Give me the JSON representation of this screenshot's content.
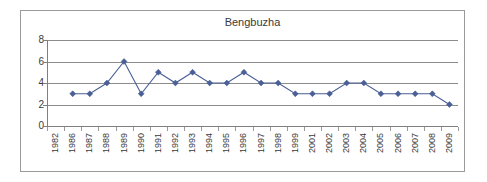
{
  "chart_data": {
    "type": "line",
    "title": "Bengbuzha",
    "xlabel": "",
    "ylabel": "",
    "ylim": [
      0,
      8
    ],
    "ytick_labels": [
      "8",
      "6",
      "4",
      "2",
      "0"
    ],
    "ytick_values": [
      8,
      6,
      4,
      2,
      0
    ],
    "grid": true,
    "grid_orientation": "horizontal",
    "legend": false,
    "legend_position": "none",
    "marker": "diamond",
    "series_color": "#4a5f96",
    "categories": [
      "1982",
      "1986",
      "1987",
      "1988",
      "1989",
      "1990",
      "1991",
      "1992",
      "1993",
      "1994",
      "1995",
      "1996",
      "1997",
      "1998",
      "1999",
      "2001",
      "2002",
      "2003",
      "2004",
      "2005",
      "2006",
      "2007",
      "2008",
      "2009"
    ],
    "values": [
      null,
      3,
      3,
      4,
      6,
      3,
      5,
      4,
      5,
      4,
      4,
      5,
      4,
      4,
      3,
      3,
      3,
      4,
      4,
      3,
      3,
      3,
      3,
      2
    ],
    "points": [
      {
        "x": "1982",
        "y": null
      },
      {
        "x": "1986",
        "y": 3
      },
      {
        "x": "1987",
        "y": 3
      },
      {
        "x": "1988",
        "y": 4
      },
      {
        "x": "1989",
        "y": 6
      },
      {
        "x": "1990",
        "y": 3
      },
      {
        "x": "1991",
        "y": 5
      },
      {
        "x": "1992",
        "y": 4
      },
      {
        "x": "1993",
        "y": 5
      },
      {
        "x": "1994",
        "y": 4
      },
      {
        "x": "1995",
        "y": 4
      },
      {
        "x": "1996",
        "y": 5
      },
      {
        "x": "1997",
        "y": 4
      },
      {
        "x": "1998",
        "y": 4
      },
      {
        "x": "1999",
        "y": 3
      },
      {
        "x": "2001",
        "y": 3
      },
      {
        "x": "2002",
        "y": 3
      },
      {
        "x": "2003",
        "y": 4
      },
      {
        "x": "2004",
        "y": 4
      },
      {
        "x": "2005",
        "y": 3
      },
      {
        "x": "2006",
        "y": 3
      },
      {
        "x": "2007",
        "y": 3
      },
      {
        "x": "2008",
        "y": 3
      },
      {
        "x": "2009",
        "y": 2
      }
    ]
  },
  "colors": {
    "series": "#4a5f96",
    "gridline": "#8c8c8c",
    "axis": "#7f7f7f",
    "border": "#9a9a9a",
    "text": "#3a3a3a",
    "background": "#ffffff"
  }
}
